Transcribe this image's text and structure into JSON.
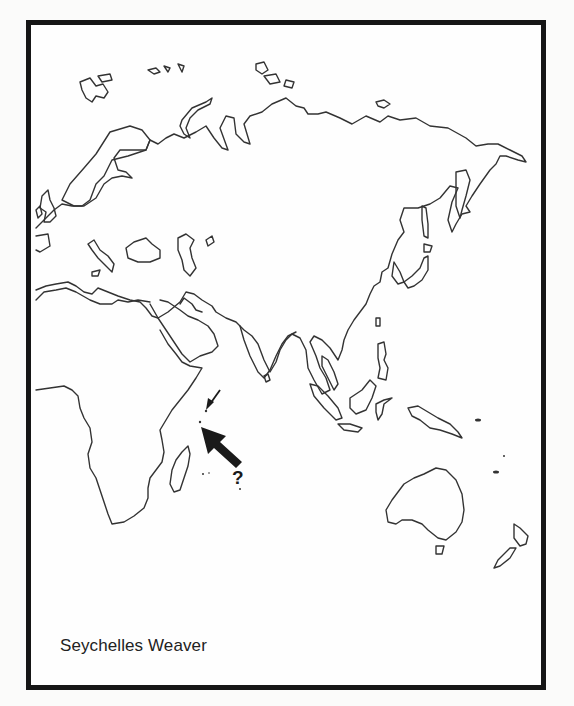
{
  "map": {
    "title": "Seychelles Weaver",
    "projection": "outline map of Europe, Africa, Asia and Australasia",
    "regions_shown": [
      "Europe",
      "Africa",
      "Middle East",
      "Asia",
      "Southeast Asia",
      "Australia",
      "New Zealand",
      "Madagascar"
    ],
    "markers": [
      {
        "type": "small-arrow",
        "points_to": "Seychelles",
        "label": ""
      },
      {
        "type": "large-arrow",
        "points_to": "Seychelles (uncertain range)",
        "label": "?"
      }
    ],
    "line_color": "#333333",
    "frame_color": "#161616",
    "background": "#fefefe"
  }
}
